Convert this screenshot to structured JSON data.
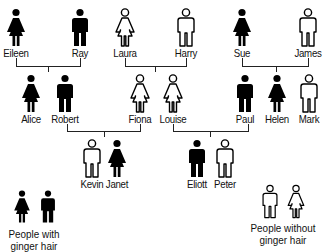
{
  "colors": {
    "ginger": "#000000",
    "non_ginger": "#ffffff",
    "stroke": "#000000",
    "line": "#222222"
  },
  "people": [
    {
      "name": "Eileen",
      "sex": "female",
      "ginger": true,
      "x": 16,
      "y": 8,
      "gen": 1
    },
    {
      "name": "Ray",
      "sex": "male",
      "ginger": true,
      "x": 80,
      "y": 8,
      "gen": 1
    },
    {
      "name": "Laura",
      "sex": "female",
      "ginger": false,
      "x": 125,
      "y": 8,
      "gen": 1
    },
    {
      "name": "Harry",
      "sex": "male",
      "ginger": false,
      "x": 186,
      "y": 8,
      "gen": 1
    },
    {
      "name": "Sue",
      "sex": "female",
      "ginger": true,
      "x": 242,
      "y": 8,
      "gen": 1
    },
    {
      "name": "James",
      "sex": "male",
      "ginger": false,
      "x": 308,
      "y": 8,
      "gen": 1
    },
    {
      "name": "Alice",
      "sex": "female",
      "ginger": true,
      "x": 31,
      "y": 74,
      "gen": 2
    },
    {
      "name": "Robert",
      "sex": "male",
      "ginger": true,
      "x": 65,
      "y": 74,
      "gen": 2
    },
    {
      "name": "Fiona",
      "sex": "female",
      "ginger": false,
      "x": 140,
      "y": 74,
      "gen": 2
    },
    {
      "name": "Louise",
      "sex": "female",
      "ginger": false,
      "x": 173,
      "y": 74,
      "gen": 2
    },
    {
      "name": "Paul",
      "sex": "male",
      "ginger": true,
      "x": 245,
      "y": 74,
      "gen": 2
    },
    {
      "name": "Helen",
      "sex": "female",
      "ginger": true,
      "x": 277,
      "y": 74,
      "gen": 2
    },
    {
      "name": "Mark",
      "sex": "male",
      "ginger": false,
      "x": 309,
      "y": 74,
      "gen": 2
    },
    {
      "name": "Kevin",
      "sex": "male",
      "ginger": false,
      "x": 92,
      "y": 139,
      "gen": 3
    },
    {
      "name": "Janet",
      "sex": "female",
      "ginger": true,
      "x": 117,
      "y": 139,
      "gen": 3
    },
    {
      "name": "Eliott",
      "sex": "male",
      "ginger": true,
      "x": 197,
      "y": 139,
      "gen": 3
    },
    {
      "name": "Peter",
      "sex": "male",
      "ginger": false,
      "x": 225,
      "y": 139,
      "gen": 3
    }
  ],
  "couples": [
    {
      "parents": [
        "Eileen",
        "Ray"
      ],
      "children": [
        "Alice",
        "Robert"
      ]
    },
    {
      "parents": [
        "Laura",
        "Harry"
      ],
      "children": [
        "Fiona",
        "Louise"
      ]
    },
    {
      "parents": [
        "Sue",
        "James"
      ],
      "children": [
        "Paul",
        "Helen",
        "Mark"
      ]
    },
    {
      "parents": [
        "Robert",
        "Fiona"
      ],
      "children": [
        "Kevin",
        "Janet"
      ]
    },
    {
      "parents": [
        "Louise",
        "Paul"
      ],
      "children": [
        "Eliott",
        "Peter"
      ]
    }
  ],
  "connectors": [
    {
      "left": 16,
      "right": 80,
      "bar_y": 66,
      "top_y": 58,
      "drop_x": 48,
      "drop_to": 72
    },
    {
      "left": 125,
      "right": 186,
      "bar_y": 66,
      "top_y": 58,
      "drop_x": 155,
      "drop_to": 72
    },
    {
      "left": 242,
      "right": 308,
      "bar_y": 66,
      "top_y": 58,
      "drop_x": 276,
      "drop_to": 72
    },
    {
      "left": 67,
      "right": 140,
      "bar_y": 131,
      "top_y": 124,
      "drop_x": 104,
      "drop_to": 137
    },
    {
      "left": 173,
      "right": 248,
      "bar_y": 131,
      "top_y": 124,
      "drop_x": 210,
      "drop_to": 137
    }
  ],
  "legend": {
    "ginger": {
      "line1": "People with",
      "line2": "ginger hair"
    },
    "non_ginger": {
      "line1": "People without",
      "line2": "ginger hair"
    }
  }
}
